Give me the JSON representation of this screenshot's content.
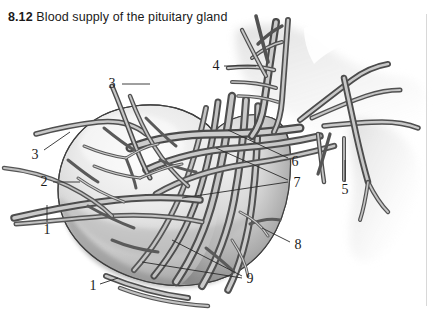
{
  "figure": {
    "number": "8.12",
    "title": "Blood supply of the pituitary gland"
  },
  "diagram": {
    "type": "anatomical-illustration",
    "style": "grayscale airbrush medical illustration",
    "palette": {
      "background": "#ffffff",
      "gland_light": "#f0f0f0",
      "gland_mid": "#c8c8c8",
      "gland_dark": "#8e8e8e",
      "vessel_light": "#d6d6d6",
      "vessel_mid": "#8a8a8a",
      "vessel_dark": "#4a4a4a",
      "outline": "#3a3a3a",
      "label_text": "#1b1b1b",
      "leader_line": "#2a2a2a",
      "rule": "#d8d8d8"
    }
  },
  "labels": [
    {
      "id": "label-3-upper",
      "text": "3",
      "x": 112,
      "y": 84
    },
    {
      "id": "label-4",
      "text": "4",
      "x": 216,
      "y": 66
    },
    {
      "id": "label-3-lower",
      "text": "3",
      "x": 35,
      "y": 155
    },
    {
      "id": "label-2",
      "text": "2",
      "x": 44,
      "y": 182
    },
    {
      "id": "label-6",
      "text": "6",
      "x": 295,
      "y": 162
    },
    {
      "id": "label-7",
      "text": "7",
      "x": 297,
      "y": 183
    },
    {
      "id": "label-5",
      "text": "5",
      "x": 345,
      "y": 190
    },
    {
      "id": "label-1-left",
      "text": "1",
      "x": 47,
      "y": 230
    },
    {
      "id": "label-8",
      "text": "8",
      "x": 298,
      "y": 245
    },
    {
      "id": "label-9",
      "text": "9",
      "x": 250,
      "y": 279
    },
    {
      "id": "label-1-bottom",
      "text": "1",
      "x": 93,
      "y": 286
    }
  ]
}
